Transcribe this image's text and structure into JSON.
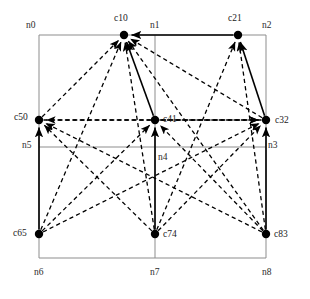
{
  "figure": {
    "type": "directed-graph-on-grid",
    "width": 310,
    "height": 299,
    "background_color": "#ffffff",
    "line_color": "#000000",
    "grid_color": "#8d8d8d"
  },
  "grid": {
    "label_name": "grid-node-labels",
    "x_positions": [
      39,
      155,
      266
    ],
    "y_positions": [
      35,
      147,
      258
    ],
    "nodes": [
      {
        "id": "n0",
        "label": "n0",
        "x": 39,
        "y": 35,
        "label_x": 26,
        "label_y": 28
      },
      {
        "id": "n1",
        "label": "n1",
        "x": 155,
        "y": 35,
        "label_x": 150,
        "label_y": 28
      },
      {
        "id": "n2",
        "label": "n2",
        "x": 266,
        "y": 35,
        "label_x": 262,
        "label_y": 28
      },
      {
        "id": "n3",
        "label": "n3",
        "x": 266,
        "y": 147,
        "label_x": 268,
        "label_y": 148
      },
      {
        "id": "n4",
        "label": "n4",
        "x": 155,
        "y": 147,
        "label_x": 158,
        "label_y": 160
      },
      {
        "id": "n5",
        "label": "n5",
        "x": 39,
        "y": 147,
        "label_x": 22,
        "label_y": 148
      },
      {
        "id": "n6",
        "label": "n6",
        "x": 39,
        "y": 258,
        "label_x": 34,
        "label_y": 275
      },
      {
        "id": "n7",
        "label": "n7",
        "x": 155,
        "y": 258,
        "label_x": 150,
        "label_y": 275
      },
      {
        "id": "n8",
        "label": "n8",
        "x": 266,
        "y": 258,
        "label_x": 262,
        "label_y": 275
      }
    ]
  },
  "vertices": [
    {
      "id": "c10",
      "label": "c10",
      "x": 124,
      "y": 35,
      "label_x": 114,
      "label_y": 21,
      "radius": 4.2
    },
    {
      "id": "c21",
      "label": "c21",
      "x": 238,
      "y": 35,
      "label_x": 228,
      "label_y": 21,
      "radius": 4.2
    },
    {
      "id": "c32",
      "label": "c32",
      "x": 266,
      "y": 120,
      "label_x": 275,
      "label_y": 123,
      "radius": 4.2
    },
    {
      "id": "c41",
      "label": "c41",
      "x": 155,
      "y": 120,
      "label_x": 163,
      "label_y": 122,
      "radius": 4.2
    },
    {
      "id": "c50",
      "label": "c50",
      "x": 39,
      "y": 120,
      "label_x": 14,
      "label_y": 120,
      "radius": 4.2
    },
    {
      "id": "c65",
      "label": "c65",
      "x": 39,
      "y": 234,
      "label_x": 13,
      "label_y": 236,
      "radius": 4.2
    },
    {
      "id": "c74",
      "label": "c74",
      "x": 155,
      "y": 234,
      "label_x": 163,
      "label_y": 237,
      "radius": 4.2
    },
    {
      "id": "c83",
      "label": "c83",
      "x": 266,
      "y": 234,
      "label_x": 274,
      "label_y": 237,
      "radius": 4.2
    }
  ],
  "edges_solid": [
    {
      "name": "edge-c21-to-c10",
      "from": "c21",
      "to": "c10",
      "x1": 238,
      "y1": 35,
      "x2": 124,
      "y2": 35,
      "arrow": true
    },
    {
      "name": "edge-c41-to-c10",
      "from": "c41",
      "to": "c10",
      "x1": 155,
      "y1": 120,
      "x2": 124,
      "y2": 35,
      "arrow": true
    },
    {
      "name": "edge-c32-to-c21",
      "from": "c32",
      "to": "c21",
      "x1": 266,
      "y1": 120,
      "x2": 238,
      "y2": 35,
      "arrow": true
    },
    {
      "name": "edge-c83-to-c32",
      "from": "c83",
      "to": "c32",
      "x1": 266,
      "y1": 234,
      "x2": 266,
      "y2": 120,
      "arrow": true
    },
    {
      "name": "edge-c74-to-c41",
      "from": "c74",
      "to": "c41",
      "x1": 155,
      "y1": 234,
      "x2": 155,
      "y2": 120,
      "arrow": true
    },
    {
      "name": "edge-c65-to-c50",
      "from": "c65",
      "to": "c50",
      "x1": 39,
      "y1": 234,
      "x2": 39,
      "y2": 120,
      "arrow": true
    }
  ],
  "edges_dashed": [
    {
      "name": "edge-c50-to-c10",
      "from": "c50",
      "to": "c10",
      "x1": 39,
      "y1": 120,
      "x2": 124,
      "y2": 35,
      "arrow": true
    },
    {
      "name": "edge-c65-to-c10",
      "from": "c65",
      "to": "c10",
      "x1": 39,
      "y1": 234,
      "x2": 124,
      "y2": 35,
      "arrow": true
    },
    {
      "name": "edge-c74-to-c10",
      "from": "c74",
      "to": "c10",
      "x1": 155,
      "y1": 234,
      "x2": 124,
      "y2": 35,
      "arrow": true
    },
    {
      "name": "edge-c32-to-c10",
      "from": "c32",
      "to": "c10",
      "x1": 266,
      "y1": 120,
      "x2": 124,
      "y2": 35,
      "arrow": true
    },
    {
      "name": "edge-c83-to-c10",
      "from": "c83",
      "to": "c10",
      "x1": 266,
      "y1": 234,
      "x2": 124,
      "y2": 35,
      "arrow": true
    },
    {
      "name": "edge-c83-to-c21",
      "from": "c83",
      "to": "c21",
      "x1": 266,
      "y1": 234,
      "x2": 238,
      "y2": 35,
      "arrow": true
    },
    {
      "name": "edge-c74-to-c21",
      "from": "c74",
      "to": "c21",
      "x1": 155,
      "y1": 234,
      "x2": 238,
      "y2": 35,
      "arrow": true
    },
    {
      "name": "edge-c41-to-c32",
      "from": "c41",
      "to": "c32",
      "x1": 155,
      "y1": 120,
      "x2": 266,
      "y2": 120,
      "arrow": true
    },
    {
      "name": "edge-c50-to-c32",
      "from": "c50",
      "to": "c32",
      "x1": 39,
      "y1": 120,
      "x2": 266,
      "y2": 120,
      "arrow": true
    },
    {
      "name": "edge-c74-to-c32",
      "from": "c74",
      "to": "c32",
      "x1": 155,
      "y1": 234,
      "x2": 266,
      "y2": 120,
      "arrow": true
    },
    {
      "name": "edge-c65-to-c32",
      "from": "c65",
      "to": "c32",
      "x1": 39,
      "y1": 234,
      "x2": 266,
      "y2": 120,
      "arrow": true
    },
    {
      "name": "edge-c65-to-c41",
      "from": "c65",
      "to": "c41",
      "x1": 39,
      "y1": 234,
      "x2": 155,
      "y2": 120,
      "arrow": true
    },
    {
      "name": "edge-c83-to-c41",
      "from": "c83",
      "to": "c41",
      "x1": 266,
      "y1": 234,
      "x2": 155,
      "y2": 120,
      "arrow": true
    },
    {
      "name": "edge-c32-to-c50",
      "from": "c32",
      "to": "c50",
      "x1": 266,
      "y1": 120,
      "x2": 39,
      "y2": 120,
      "arrow": true
    },
    {
      "name": "edge-c83-to-c50",
      "from": "c83",
      "to": "c50",
      "x1": 266,
      "y1": 234,
      "x2": 39,
      "y2": 120,
      "arrow": true
    },
    {
      "name": "edge-c74-to-c50",
      "from": "c74",
      "to": "c50",
      "x1": 155,
      "y1": 234,
      "x2": 39,
      "y2": 120,
      "arrow": true
    }
  ]
}
